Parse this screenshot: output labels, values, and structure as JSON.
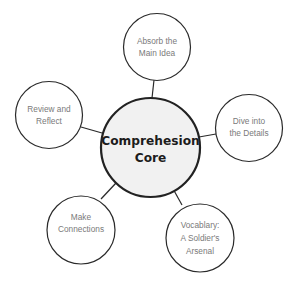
{
  "diagram": {
    "type": "mind-map",
    "center": {
      "lines": [
        "Comprehesion",
        "Core"
      ],
      "fill": "#f1f1f1",
      "stroke": "#222222"
    },
    "nodes": [
      {
        "id": "main-idea",
        "lines": [
          "Absorb the",
          "Main Idea"
        ]
      },
      {
        "id": "details",
        "lines": [
          "Dive into",
          "the Details"
        ]
      },
      {
        "id": "vocabulary",
        "lines": [
          "Vocablary:",
          "A Soldier's",
          "Arsenal"
        ]
      },
      {
        "id": "connections",
        "lines": [
          "Make",
          "Connections"
        ]
      },
      {
        "id": "review",
        "lines": [
          "Review and",
          "Reflect"
        ]
      }
    ],
    "colors": {
      "node_stroke": "#2a2a2a",
      "node_text": "#7a7a7a",
      "center_text": "#1c1c1c",
      "background": "#ffffff"
    }
  }
}
